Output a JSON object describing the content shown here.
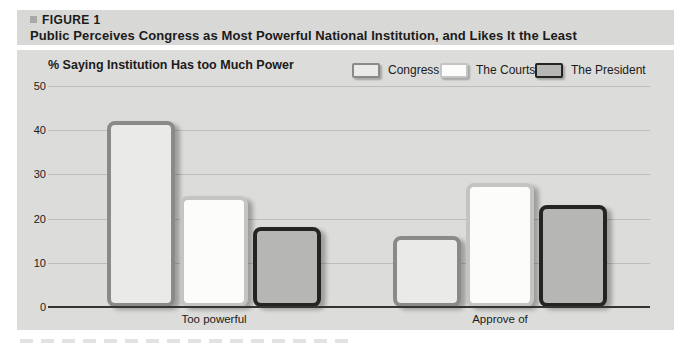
{
  "figure": {
    "label": "FIGURE 1",
    "title": "Public Perceives Congress as Most Powerful National Institution, and Likes It the Least"
  },
  "chart_data": {
    "type": "bar",
    "title": "% Saying Institution Has too Much Power",
    "xlabel": "",
    "ylabel": "",
    "categories": [
      "Too powerful",
      "Approve of"
    ],
    "series": [
      {
        "name": "Congress",
        "values": [
          42,
          16
        ],
        "fill": "#eaeae8",
        "border": "#8a8a88"
      },
      {
        "name": "The Courts",
        "values": [
          25,
          28
        ],
        "fill": "#fcfcfa",
        "border": "#c4c4c2"
      },
      {
        "name": "The President",
        "values": [
          18,
          23
        ],
        "fill": "#b6b6b4",
        "border": "#242422"
      }
    ],
    "ylim": [
      0,
      50
    ],
    "yticks": [
      0,
      10,
      20,
      30,
      40,
      50
    ],
    "grid": true,
    "legend_position": "top-right"
  },
  "colors": {
    "header_bg": "#d8d8d6",
    "panel_bg": "#dcdcda",
    "gridline": "#bdbdbb",
    "axis": "#343432",
    "text": "#1b1b1b"
  }
}
